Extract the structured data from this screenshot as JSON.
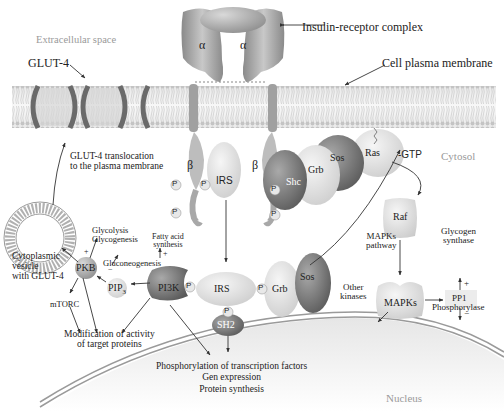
{
  "regions": {
    "extracellular": "Extracellular space",
    "cytosol": "Cytosol",
    "nucleus": "Nucleus"
  },
  "callouts": {
    "glut4": "GLUT-4",
    "insulin_receptor": "Insulin-receptor complex",
    "plasma_membrane": "Cell plasma membrane"
  },
  "receptor": {
    "alpha_left": "α",
    "alpha_right": "α",
    "beta_left": "β",
    "beta_right": "β"
  },
  "translocation": {
    "line1": "GLUT-4 translocation",
    "line2": "to the plasma membrane"
  },
  "vesicle": {
    "line1": "Cytoplasmic",
    "line2": "vesicle",
    "line3": "with GLUT-4"
  },
  "proteins": {
    "irs_top": "IRS",
    "irs_center": "IRS",
    "shc": "Shc",
    "grb_top": "Grb",
    "sos_top": "Sos",
    "ras": "Ras",
    "gtp": "-GTP",
    "raf": "Raf",
    "mapks": "MAPKs",
    "pp1": "PP1",
    "grb_bottom": "Grb",
    "sos_bottom": "Sos",
    "pi3k": "PI3K",
    "sh2": "SH2",
    "pkb": "PKB",
    "pip3": "PIP",
    "pip3_sub": "3"
  },
  "phospho": "P",
  "effects": {
    "glycolysis": "Glycolysis",
    "glycogenesis": "Glycogenesis",
    "gluconeogenesis": "Gluconeogenesis",
    "fatty_acid_1": "Fatty acid",
    "fatty_acid_2": "synthesis",
    "mtorc": "mTORC",
    "modification_1": "Modification of activity",
    "modification_2": "of target proteins",
    "mapk_pathway_1": "MAPKs",
    "mapk_pathway_2": "pathway",
    "other_kinases_1": "Other",
    "other_kinases_2": "kinases",
    "glycogen_synthase_1": "Glycogen",
    "glycogen_synthase_2": "synthase",
    "phosphorylase": "Phosphorylase",
    "nuclear_1": "Phosphorylation of transcription factors",
    "nuclear_2": "Gen expression",
    "nuclear_3": "Protein synthesis"
  },
  "signs": {
    "plus": "+",
    "minus": "−"
  },
  "colors": {
    "membrane": "#bdbdbd",
    "protein_dark": "#7a7a7a",
    "protein_mid": "#a8a8a8",
    "protein_light": "#dcdcdc",
    "region_label": "#9a9a9a",
    "text": "#222222"
  }
}
